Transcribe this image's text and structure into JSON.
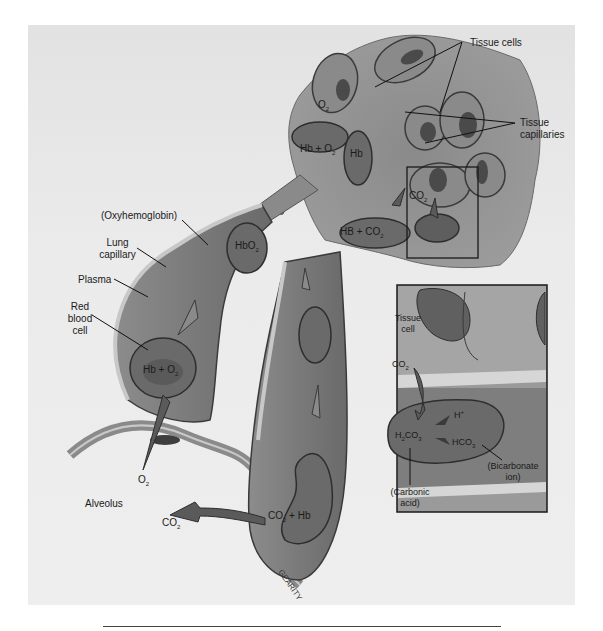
{
  "figure": {
    "type": "anatomical-illustration",
    "artist_signature": "GEARITY"
  },
  "labels": {
    "tissue_cells": "Tissue cells",
    "tissue_capillaries_line1": "Tissue",
    "tissue_capillaries_line2": "capillaries",
    "oxyhemoglobin": "(Oxyhemoglobin)",
    "lung_capillary_line1": "Lung",
    "lung_capillary_line2": "capillary",
    "plasma": "Plasma",
    "red_blood_cell_line1": "Red",
    "red_blood_cell_line2": "blood",
    "red_blood_cell_line3": "cell",
    "alveolus": "Alveolus",
    "o2_alveolus": "O",
    "o2_alveolus_sub": "2",
    "co2_alveolus": "CO",
    "co2_alveolus_sub": "2",
    "hb_plus_o2_lung": "Hb + O",
    "hb_plus_o2_lung_sub": "2",
    "hbo2": "HbO",
    "hbo2_sub": "2",
    "co2_plus_hb": "CO",
    "co2_plus_hb_sub": "2",
    "co2_plus_hb_tail": " + Hb",
    "o2_tissue": "O",
    "o2_tissue_sub": "2",
    "hb_plus_o2_tissue": "Hb + O",
    "hb_plus_o2_tissue_sub": "2",
    "hb_tissue": "Hb",
    "hb_plus_co2_tissue": "HB + CO",
    "hb_plus_co2_tissue_sub": "2",
    "co2_tissue": "CO",
    "co2_tissue_sub": "2"
  },
  "inset": {
    "tissue_cell_line1": "Tissue",
    "tissue_cell_line2": "cell",
    "co2": "CO",
    "co2_sub": "2",
    "h_plus": "H",
    "h_plus_sup": "+",
    "h2co3_a": "H",
    "h2co3_sub1": "2",
    "h2co3_b": "CO",
    "h2co3_sub2": "3",
    "hco3": "HCO",
    "hco3_sub": "3",
    "bicarbonate_line1": "(Bicarbonate",
    "bicarbonate_line2": "ion)",
    "carbonic_line1": "(Carbonic",
    "carbonic_line2": "acid)"
  },
  "colors": {
    "background": "#e8e8e8",
    "vessel_wall": "#9a9a9a",
    "vessel_fill": "#7d7d7d",
    "cell_fill": "#6f6f6f",
    "nucleus": "#4a4a4a",
    "outline": "#2e2e2e",
    "highlight": "#d8d8d8"
  }
}
